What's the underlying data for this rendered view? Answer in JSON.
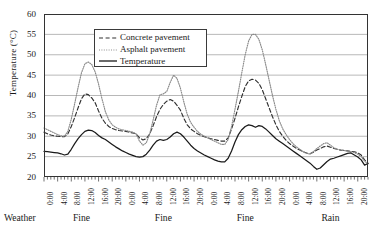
{
  "chart_data": {
    "type": "line",
    "title": "",
    "xlabel": "",
    "ylabel": "Temperature (°C)",
    "ylim": [
      20,
      60
    ],
    "yticks": [
      20,
      25,
      30,
      35,
      40,
      45,
      50,
      55,
      60
    ],
    "grid": true,
    "legend_position": "top-left",
    "x_tick_labels": [
      "0:00",
      "4:00",
      "8:00",
      "12:00",
      "16:00",
      "20:00",
      "0:00",
      "4:00",
      "8:00",
      "12:00",
      "16:00",
      "20:00",
      "0:00",
      "4:00",
      "8:00",
      "12:00",
      "16:00",
      "20:00",
      "0:00",
      "4:00",
      "8:00",
      "12:00",
      "16:00",
      "20:00"
    ],
    "x_hours": [
      0,
      1,
      2,
      3,
      4,
      5,
      6,
      7,
      8,
      9,
      10,
      11,
      12,
      13,
      14,
      15,
      16,
      17,
      18,
      19,
      20,
      21,
      22,
      23,
      24,
      25,
      26,
      27,
      28,
      29,
      30,
      31,
      32,
      33,
      34,
      35,
      36,
      37,
      38,
      39,
      40,
      41,
      42,
      43,
      44,
      45,
      46,
      47,
      48,
      49,
      50,
      51,
      52,
      53,
      54,
      55,
      56,
      57,
      58,
      59,
      60,
      61,
      62,
      63,
      64,
      65,
      66,
      67,
      68,
      69,
      70,
      71,
      72,
      73,
      74,
      75,
      76,
      77,
      78,
      79,
      80,
      81,
      82,
      83,
      84,
      85,
      86,
      87,
      88,
      89,
      90,
      91,
      92,
      93,
      94,
      95
    ],
    "series": [
      {
        "name": "Concrete pavement",
        "style": "dashed",
        "color": "#303030",
        "values": [
          31.0,
          30.6,
          30.3,
          30.1,
          30.0,
          29.9,
          29.9,
          30.6,
          32.4,
          34.6,
          37.0,
          39.2,
          40.4,
          40.2,
          39.4,
          38.2,
          36.2,
          34.4,
          33.2,
          32.4,
          31.9,
          31.6,
          31.4,
          31.3,
          31.2,
          31.0,
          30.8,
          30.6,
          29.6,
          29.1,
          29.4,
          30.6,
          32.6,
          34.8,
          36.6,
          37.8,
          38.6,
          39.0,
          38.6,
          37.6,
          36.4,
          34.4,
          32.8,
          31.8,
          31.2,
          30.6,
          30.2,
          29.9,
          29.6,
          29.4,
          29.2,
          29.0,
          28.8,
          28.8,
          29.6,
          31.8,
          34.4,
          37.2,
          39.8,
          42.2,
          43.6,
          44.0,
          43.8,
          43.0,
          41.4,
          39.2,
          37.0,
          34.8,
          32.8,
          31.2,
          30.0,
          29.0,
          28.2,
          27.6,
          27.0,
          26.6,
          26.2,
          25.9,
          25.7,
          26.1,
          26.6,
          27.0,
          27.4,
          27.6,
          27.3,
          27.0,
          26.8,
          26.6,
          26.5,
          26.4,
          26.3,
          26.2,
          25.9,
          25.4,
          24.2,
          23.4
        ]
      },
      {
        "name": "Asphalt pavement",
        "style": "dotted",
        "color": "#808080",
        "values": [
          32.0,
          31.6,
          31.2,
          30.8,
          30.4,
          30.1,
          30.0,
          31.2,
          34.2,
          38.0,
          42.0,
          45.6,
          47.8,
          48.2,
          47.6,
          45.8,
          42.8,
          39.2,
          36.0,
          34.0,
          32.8,
          32.2,
          31.8,
          31.6,
          31.4,
          31.2,
          31.0,
          30.6,
          28.8,
          27.8,
          28.4,
          30.6,
          34.0,
          37.6,
          40.2,
          40.4,
          41.0,
          43.2,
          45.0,
          44.2,
          41.8,
          38.4,
          35.4,
          33.4,
          32.2,
          31.2,
          30.5,
          30.0,
          29.6,
          29.2,
          28.8,
          28.4,
          28.0,
          28.0,
          29.2,
          32.4,
          36.6,
          41.0,
          45.6,
          50.0,
          53.4,
          55.0,
          55.0,
          53.8,
          51.2,
          47.6,
          43.8,
          40.0,
          36.6,
          33.8,
          31.8,
          30.4,
          29.2,
          28.2,
          27.4,
          26.8,
          26.2,
          25.8,
          25.6,
          26.2,
          27.0,
          27.6,
          28.2,
          28.4,
          27.8,
          27.2,
          26.8,
          26.6,
          26.5,
          26.4,
          26.2,
          26.0,
          25.6,
          25.0,
          23.9,
          23.2
        ]
      },
      {
        "name": "Temperature",
        "style": "solid",
        "color": "#1a1a1a",
        "values": [
          26.3,
          26.2,
          26.1,
          26.0,
          25.9,
          25.7,
          25.4,
          25.6,
          26.8,
          28.2,
          29.4,
          30.4,
          31.2,
          31.5,
          31.4,
          30.9,
          30.2,
          29.6,
          29.2,
          28.6,
          28.0,
          27.4,
          26.9,
          26.4,
          26.0,
          25.6,
          25.3,
          25.0,
          24.9,
          25.0,
          25.6,
          26.6,
          27.8,
          28.8,
          29.2,
          29.0,
          29.2,
          29.8,
          30.6,
          31.0,
          30.6,
          29.8,
          28.8,
          27.8,
          27.0,
          26.4,
          25.9,
          25.4,
          25.0,
          24.6,
          24.2,
          23.9,
          23.7,
          23.7,
          24.6,
          26.4,
          28.6,
          30.4,
          31.6,
          32.4,
          32.8,
          32.6,
          32.2,
          32.6,
          32.4,
          31.8,
          31.0,
          30.2,
          29.4,
          28.8,
          28.2,
          27.6,
          27.0,
          26.4,
          25.8,
          25.2,
          24.6,
          24.0,
          23.4,
          22.6,
          21.9,
          22.2,
          23.0,
          23.8,
          24.4,
          24.6,
          24.9,
          25.2,
          25.5,
          25.8,
          25.9,
          25.4,
          24.9,
          24.2,
          22.9,
          23.3
        ]
      }
    ],
    "weather_row": {
      "label": "Weather",
      "segments": [
        {
          "text": "Fine",
          "center_hour": 11
        },
        {
          "text": "Fine",
          "center_hour": 35
        },
        {
          "text": "Fine",
          "center_hour": 59
        },
        {
          "text": "Rain",
          "center_hour": 84
        }
      ]
    }
  }
}
